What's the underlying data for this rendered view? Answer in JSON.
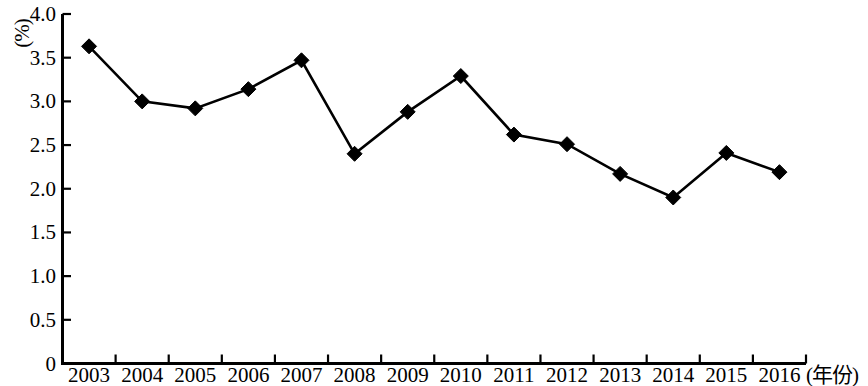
{
  "chart_data": {
    "type": "line",
    "title": "",
    "subtitle": "",
    "xlabel": "(年份)",
    "ylabel": "(%)",
    "categories": [
      "2003",
      "2004",
      "2005",
      "2006",
      "2007",
      "2008",
      "2009",
      "2010",
      "2011",
      "2012",
      "2013",
      "2014",
      "2015",
      "2016"
    ],
    "values": [
      3.63,
      3.0,
      2.92,
      3.14,
      3.47,
      2.4,
      2.88,
      3.29,
      2.62,
      2.51,
      2.17,
      1.9,
      2.41,
      2.19
    ],
    "series": [
      {
        "name": "",
        "values": [
          3.63,
          3.0,
          2.92,
          3.14,
          3.47,
          2.4,
          2.88,
          3.29,
          2.62,
          2.51,
          2.17,
          1.9,
          2.41,
          2.19
        ]
      }
    ],
    "ylim": [
      0,
      4.0
    ],
    "ytick_values": [
      0,
      0.5,
      1.0,
      1.5,
      2.0,
      2.5,
      3.0,
      3.5,
      4.0
    ],
    "ytick_labels": [
      "0",
      "0.5",
      "1.0",
      "1.5",
      "2.0",
      "2.5",
      "3.0",
      "3.5",
      "4.0"
    ],
    "grid": false,
    "legend": "none",
    "marker": "diamond",
    "line_color": "#000000",
    "marker_color": "#000000",
    "axis_color": "#000000"
  },
  "axes": {
    "y_unit_label": "(%)",
    "x_axis_title": "(年份)"
  }
}
